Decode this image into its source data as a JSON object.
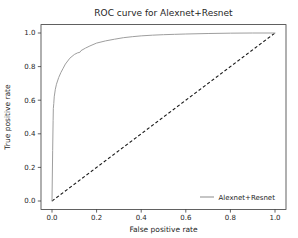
{
  "figure": {
    "background": "#ffffff",
    "text_color": "#262626",
    "spine_color": "#3a3a3a"
  },
  "chart_data": {
    "type": "line",
    "title": "ROC curve for Alexnet+Resnet",
    "xlabel": "False positive rate",
    "ylabel": "True positive rate",
    "xlim": [
      0.0,
      1.0
    ],
    "ylim": [
      0.0,
      1.0
    ],
    "xticks": [
      "0.0",
      "0.2",
      "0.4",
      "0.6",
      "0.8",
      "1.0"
    ],
    "yticks": [
      "0.0",
      "0.2",
      "0.4",
      "0.6",
      "0.8",
      "1.0"
    ],
    "grid": false,
    "legend": {
      "position": "lower right",
      "frame": false,
      "entries": [
        "Alexnet+Resnet"
      ]
    },
    "series": [
      {
        "name": "Alexnet+Resnet",
        "color": "#9e9e9e",
        "line_style": "solid",
        "in_legend": true,
        "points": [
          [
            0.0,
            0.0
          ],
          [
            0.003,
            0.3
          ],
          [
            0.005,
            0.48
          ],
          [
            0.006,
            0.55
          ],
          [
            0.008,
            0.58
          ],
          [
            0.01,
            0.62
          ],
          [
            0.015,
            0.665
          ],
          [
            0.02,
            0.695
          ],
          [
            0.03,
            0.735
          ],
          [
            0.04,
            0.765
          ],
          [
            0.05,
            0.79
          ],
          [
            0.06,
            0.815
          ],
          [
            0.08,
            0.85
          ],
          [
            0.1,
            0.872
          ],
          [
            0.115,
            0.882
          ],
          [
            0.125,
            0.885
          ],
          [
            0.13,
            0.895
          ],
          [
            0.15,
            0.91
          ],
          [
            0.17,
            0.923
          ],
          [
            0.2,
            0.94
          ],
          [
            0.24,
            0.953
          ],
          [
            0.28,
            0.963
          ],
          [
            0.32,
            0.972
          ],
          [
            0.36,
            0.978
          ],
          [
            0.4,
            0.983
          ],
          [
            0.45,
            0.987
          ],
          [
            0.5,
            0.99
          ],
          [
            0.55,
            0.992
          ],
          [
            0.6,
            0.994
          ],
          [
            0.7,
            0.997
          ],
          [
            0.8,
            0.999
          ],
          [
            0.9,
            1.0
          ],
          [
            1.0,
            1.0
          ]
        ]
      },
      {
        "name": "chance",
        "color": "#1a1a1a",
        "line_style": "dashed",
        "in_legend": false,
        "points": [
          [
            0.0,
            0.0
          ],
          [
            1.0,
            1.0
          ]
        ]
      }
    ]
  }
}
